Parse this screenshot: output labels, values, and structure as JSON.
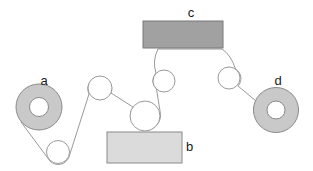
{
  "figure": {
    "labels": {
      "roll_a": "a",
      "plate_b": "b",
      "unit_c": "c",
      "roll_d": "d"
    },
    "colors": {
      "background": "#ffffff",
      "roll_fill": "#c9c9c9",
      "unit_c_fill": "#a1a1a1",
      "plate_b_fill": "#dbdbdb",
      "roller_fill": "#ffffff",
      "core_fill": "#ffffff",
      "web_line": "#9a9a9a",
      "label_text": "#1a1a1a"
    }
  }
}
